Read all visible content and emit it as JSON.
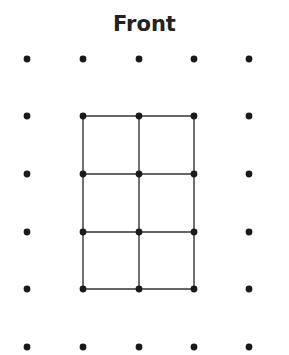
{
  "title": "Front",
  "colors": {
    "dot": "#1a1a1a",
    "line": "#333333"
  },
  "grid": {
    "columns_x": [
      27,
      83,
      139,
      194,
      249
    ],
    "rows_y": [
      59,
      116,
      174,
      232,
      289,
      347
    ],
    "dot_radius": 3.4
  },
  "figure": {
    "col_range": [
      1,
      3
    ],
    "row_range": [
      1,
      4
    ]
  }
}
